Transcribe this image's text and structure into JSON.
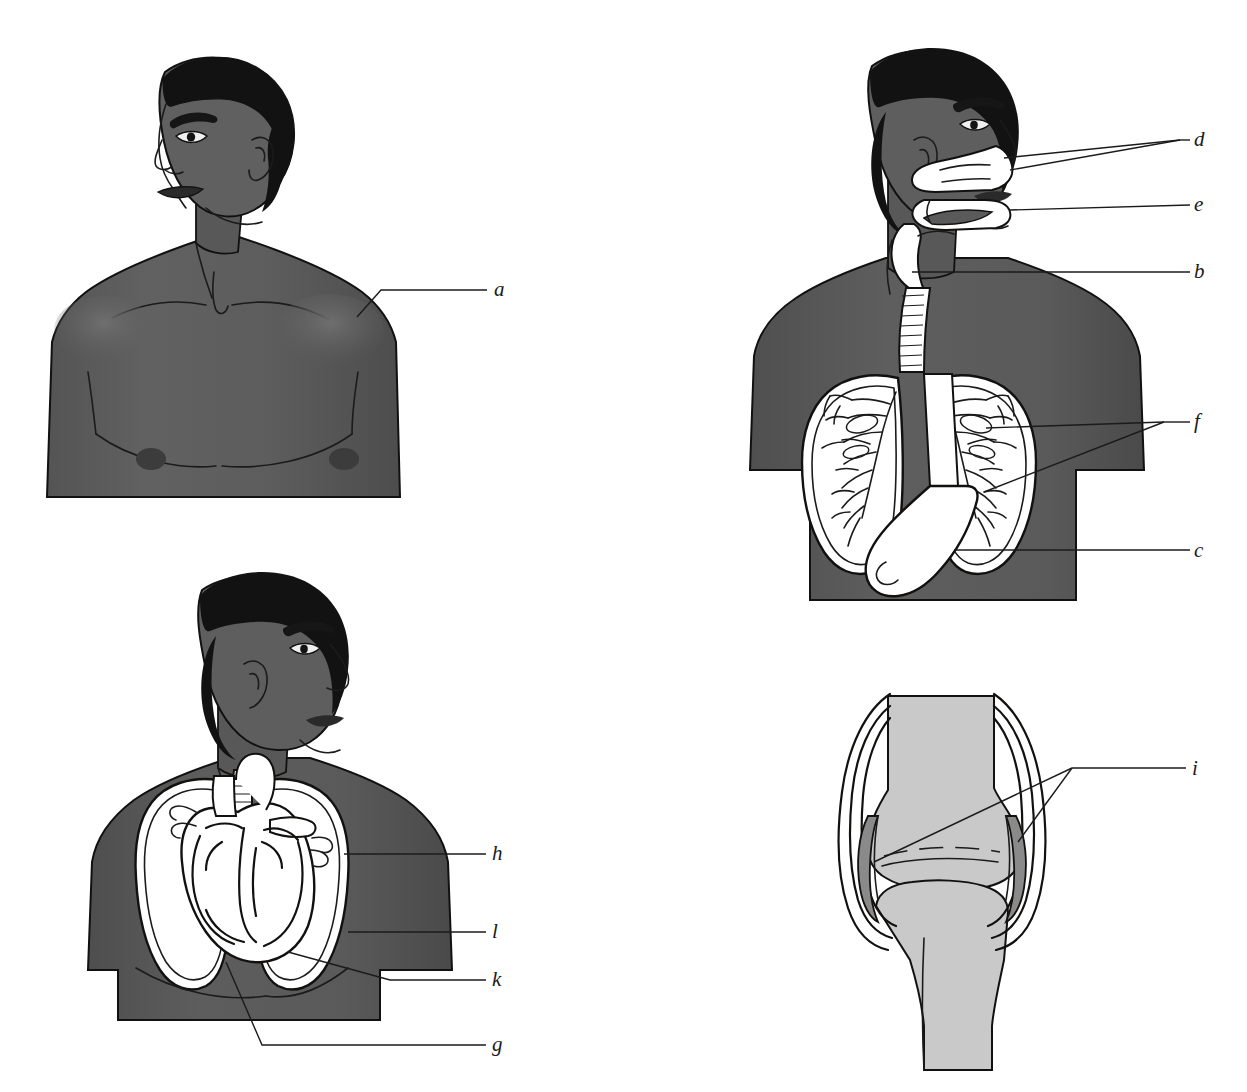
{
  "figure": {
    "kind": "anatomy-labeling-diagram",
    "colors": {
      "background": "#ffffff",
      "skin": "#5d5d5d",
      "skin_shadow": "#4a4a4a",
      "skin_highlight": "#6e6e6e",
      "hair": "#121212",
      "organ_fill": "#ffffff",
      "outline": "#12110f",
      "leader_line": "#1b1b1b",
      "bone": "#c9c9c9",
      "cartilage": "#8a8a8a",
      "label_text": "#1b1b1b"
    }
  },
  "panels": [
    {
      "id": "panel-upper-left",
      "name": "external-torso-front-view",
      "labels": [
        {
          "key": "a",
          "text": "a"
        }
      ]
    },
    {
      "id": "panel-upper-right",
      "name": "respiratory-digestive-system",
      "labels": [
        {
          "key": "d",
          "text": "d"
        },
        {
          "key": "e",
          "text": "e"
        },
        {
          "key": "b",
          "text": "b"
        },
        {
          "key": "f",
          "text": "f"
        },
        {
          "key": "c",
          "text": "c"
        }
      ]
    },
    {
      "id": "panel-lower-left",
      "name": "heart-and-lungs-thorax",
      "labels": [
        {
          "key": "h",
          "text": "h"
        },
        {
          "key": "l",
          "text": "l"
        },
        {
          "key": "k",
          "text": "k"
        },
        {
          "key": "g",
          "text": "g"
        }
      ]
    },
    {
      "id": "panel-lower-right",
      "name": "knee-joint-cross-section",
      "labels": [
        {
          "key": "i",
          "text": "i"
        }
      ]
    }
  ],
  "callouts": {
    "a": "a",
    "b": "b",
    "c": "c",
    "d": "d",
    "e": "e",
    "f": "f",
    "g": "g",
    "h": "h",
    "i": "i",
    "k": "k",
    "l": "l"
  }
}
